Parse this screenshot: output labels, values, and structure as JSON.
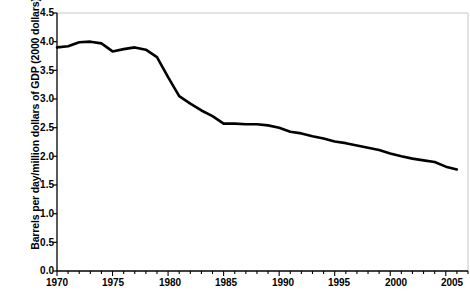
{
  "chart_data": {
    "type": "line",
    "title": "",
    "xlabel": "",
    "ylabel": "Barrels per day/million dollars of GDP (2000 dollars)",
    "xlim": [
      1970,
      2007
    ],
    "ylim": [
      0.0,
      4.5
    ],
    "grid": false,
    "legend": "none",
    "y_ticks": [
      "0.0",
      "0.5",
      "1.0",
      "1.5",
      "2.0",
      "2.5",
      "3.0",
      "3.5",
      "4.0",
      "4.5"
    ],
    "y_tick_values": [
      0.0,
      0.5,
      1.0,
      1.5,
      2.0,
      2.5,
      3.0,
      3.5,
      4.0,
      4.5
    ],
    "x_ticks": [
      "1970",
      "1975",
      "1980",
      "1985",
      "1990",
      "1995",
      "2000",
      "2005"
    ],
    "x_tick_values": [
      1970,
      1975,
      1980,
      1985,
      1990,
      1995,
      2000,
      2005
    ],
    "x_minor_tick_interval": 1,
    "line_color": "#000000",
    "line_width": 2.6,
    "series": [
      {
        "name": "Oil intensity",
        "x": [
          1970,
          1971,
          1972,
          1973,
          1974,
          1975,
          1976,
          1977,
          1978,
          1979,
          1980,
          1981,
          1982,
          1983,
          1984,
          1985,
          1986,
          1987,
          1988,
          1989,
          1990,
          1991,
          1992,
          1993,
          1994,
          1995,
          1996,
          1997,
          1998,
          1999,
          2000,
          2001,
          2002,
          2003,
          2004,
          2005,
          2006
        ],
        "values": [
          3.9,
          3.92,
          3.99,
          4.0,
          3.97,
          3.83,
          3.87,
          3.9,
          3.86,
          3.73,
          3.38,
          3.05,
          2.92,
          2.8,
          2.7,
          2.57,
          2.57,
          2.56,
          2.56,
          2.54,
          2.5,
          2.43,
          2.4,
          2.35,
          2.31,
          2.26,
          2.23,
          2.19,
          2.15,
          2.11,
          2.05,
          2.0,
          1.96,
          1.93,
          1.9,
          1.82,
          1.77
        ]
      }
    ]
  },
  "axes": {
    "plot_left_px": 57,
    "plot_right_px": 468,
    "plot_top_px": 13,
    "plot_bottom_px": 271
  }
}
